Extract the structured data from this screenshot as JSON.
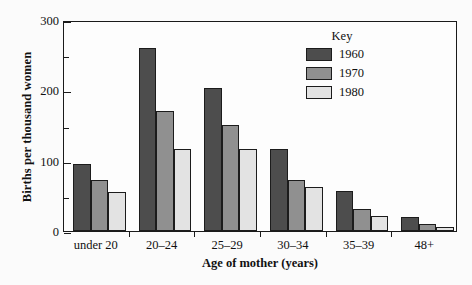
{
  "chart_data": {
    "type": "bar",
    "title": "",
    "xlabel": "Age of mother (years)",
    "ylabel": "Births per thousand women",
    "categories": [
      "under 20",
      "20–24",
      "25–29",
      "30–34",
      "35–39",
      "48+"
    ],
    "series": [
      {
        "name": "1960",
        "color": "#4d4d4d",
        "values": [
          95,
          260,
          203,
          117,
          57,
          20
        ]
      },
      {
        "name": "1970",
        "color": "#909090",
        "values": [
          73,
          171,
          151,
          72,
          31,
          10
        ]
      },
      {
        "name": "1980",
        "color": "#e3e3e3",
        "values": [
          55,
          117,
          117,
          62,
          21,
          5
        ]
      }
    ],
    "ylim": [
      0,
      300
    ],
    "yticks_major": [
      0,
      100,
      200,
      300
    ],
    "yticks_minor": [
      50,
      150,
      250
    ],
    "ytick_labels": [
      "0",
      "100",
      "200",
      "300"
    ],
    "grid": false,
    "legend": {
      "title": "Key",
      "position": "top-right"
    }
  },
  "legend": {
    "title": "Key",
    "entries": [
      {
        "label": "1960",
        "color": "#4d4d4d"
      },
      {
        "label": "1970",
        "color": "#909090"
      },
      {
        "label": "1980",
        "color": "#e3e3e3"
      }
    ]
  }
}
